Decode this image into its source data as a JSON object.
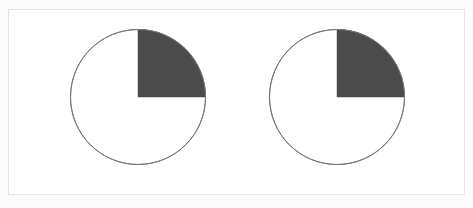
{
  "figure": {
    "background_color": "#fcfcfc",
    "panel_color": "#ffffff",
    "frame_color": "#e4e4e6",
    "width": 473,
    "height": 208
  },
  "chart_data": [
    {
      "type": "pie",
      "name": "pie-chart-left",
      "title": "",
      "labels": [
        "shaded",
        "unshaded"
      ],
      "values": [
        25,
        75
      ],
      "colors": [
        "#4b4b4b",
        "#ffffff"
      ],
      "edge_color": "#777777",
      "edge_width": 1,
      "start_angle": 90,
      "direction": "clockwise",
      "center": [
        137,
        96
      ],
      "radius": 67.5,
      "legend": "none",
      "grid": false
    },
    {
      "type": "pie",
      "name": "pie-chart-right",
      "title": "",
      "labels": [
        "shaded",
        "unshaded"
      ],
      "values": [
        25,
        75
      ],
      "colors": [
        "#4b4b4b",
        "#ffffff"
      ],
      "edge_color": "#777777",
      "edge_width": 1,
      "start_angle": 90,
      "direction": "clockwise",
      "center": [
        336,
        96
      ],
      "radius": 67.5,
      "legend": "none",
      "grid": false
    }
  ]
}
